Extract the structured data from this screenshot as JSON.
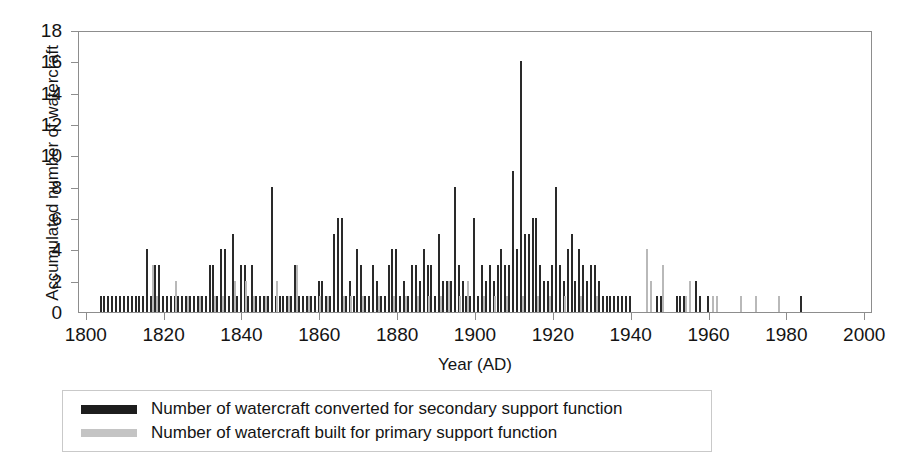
{
  "chart_data": {
    "type": "bar",
    "title": "",
    "xlabel": "Year (AD)",
    "ylabel": "Accumulated number of watercraft",
    "xlim": [
      1798,
      2002
    ],
    "ylim": [
      0,
      18
    ],
    "ytick_labels": [
      "18",
      "16",
      "14",
      "12",
      "10",
      "8",
      "6",
      "4",
      "2",
      "0"
    ],
    "ytick_values": [
      18,
      16,
      14,
      12,
      10,
      8,
      6,
      4,
      2,
      0
    ],
    "ytick_step": 2,
    "xtick_labels": [
      "1800",
      "1820",
      "1840",
      "1860",
      "1880",
      "1900",
      "1920",
      "1940",
      "1960",
      "1980",
      "2000"
    ],
    "xtick_values": [
      1800,
      1820,
      1840,
      1860,
      1880,
      1900,
      1920,
      1940,
      1960,
      1980,
      2000
    ],
    "xtick_step": 20,
    "grid": false,
    "legend_position": "below-plot",
    "colors": {
      "secondary": "#2a2a2a",
      "primary": "#b9b9b9",
      "frame": "#8d8d8d",
      "text": "#141414",
      "background": "#ffffff"
    },
    "series": [
      {
        "name": "Number of watercraft converted for secondary support function",
        "key": "secondary",
        "color": "#2a2a2a",
        "points": [
          [
            1803,
            1
          ],
          [
            1804,
            1
          ],
          [
            1805,
            1
          ],
          [
            1806,
            1
          ],
          [
            1807,
            1
          ],
          [
            1808,
            1
          ],
          [
            1809,
            1
          ],
          [
            1810,
            1
          ],
          [
            1811,
            1
          ],
          [
            1812,
            1
          ],
          [
            1813,
            1
          ],
          [
            1814,
            1
          ],
          [
            1815,
            4
          ],
          [
            1816,
            1
          ],
          [
            1817,
            3
          ],
          [
            1818,
            3
          ],
          [
            1819,
            1
          ],
          [
            1820,
            1
          ],
          [
            1821,
            1
          ],
          [
            1822,
            1
          ],
          [
            1823,
            1
          ],
          [
            1824,
            1
          ],
          [
            1825,
            1
          ],
          [
            1826,
            1
          ],
          [
            1827,
            1
          ],
          [
            1828,
            1
          ],
          [
            1829,
            1
          ],
          [
            1830,
            1
          ],
          [
            1831,
            3
          ],
          [
            1832,
            3
          ],
          [
            1833,
            1
          ],
          [
            1834,
            4
          ],
          [
            1835,
            4
          ],
          [
            1836,
            1
          ],
          [
            1837,
            5
          ],
          [
            1838,
            1
          ],
          [
            1839,
            3
          ],
          [
            1840,
            3
          ],
          [
            1841,
            1
          ],
          [
            1842,
            3
          ],
          [
            1843,
            1
          ],
          [
            1844,
            1
          ],
          [
            1845,
            1
          ],
          [
            1846,
            1
          ],
          [
            1847,
            8
          ],
          [
            1848,
            1
          ],
          [
            1849,
            1
          ],
          [
            1850,
            1
          ],
          [
            1851,
            1
          ],
          [
            1852,
            1
          ],
          [
            1853,
            3
          ],
          [
            1854,
            1
          ],
          [
            1855,
            1
          ],
          [
            1856,
            1
          ],
          [
            1857,
            1
          ],
          [
            1858,
            1
          ],
          [
            1859,
            2
          ],
          [
            1860,
            2
          ],
          [
            1861,
            1
          ],
          [
            1862,
            1
          ],
          [
            1863,
            5
          ],
          [
            1864,
            6
          ],
          [
            1865,
            6
          ],
          [
            1866,
            1
          ],
          [
            1867,
            2
          ],
          [
            1868,
            1
          ],
          [
            1869,
            4
          ],
          [
            1870,
            3
          ],
          [
            1871,
            1
          ],
          [
            1872,
            1
          ],
          [
            1873,
            3
          ],
          [
            1874,
            2
          ],
          [
            1875,
            1
          ],
          [
            1876,
            1
          ],
          [
            1877,
            3
          ],
          [
            1878,
            4
          ],
          [
            1879,
            4
          ],
          [
            1880,
            1
          ],
          [
            1881,
            2
          ],
          [
            1882,
            1
          ],
          [
            1883,
            3
          ],
          [
            1884,
            3
          ],
          [
            1885,
            2
          ],
          [
            1886,
            4
          ],
          [
            1887,
            3
          ],
          [
            1888,
            3
          ],
          [
            1889,
            1
          ],
          [
            1890,
            5
          ],
          [
            1891,
            2
          ],
          [
            1892,
            2
          ],
          [
            1893,
            2
          ],
          [
            1894,
            8
          ],
          [
            1895,
            3
          ],
          [
            1896,
            2
          ],
          [
            1897,
            1
          ],
          [
            1898,
            1
          ],
          [
            1899,
            6
          ],
          [
            1900,
            1
          ],
          [
            1901,
            3
          ],
          [
            1902,
            2
          ],
          [
            1903,
            3
          ],
          [
            1904,
            2
          ],
          [
            1905,
            3
          ],
          [
            1906,
            4
          ],
          [
            1907,
            3
          ],
          [
            1908,
            3
          ],
          [
            1909,
            9
          ],
          [
            1910,
            4
          ],
          [
            1911,
            16
          ],
          [
            1912,
            5
          ],
          [
            1913,
            5
          ],
          [
            1914,
            6
          ],
          [
            1915,
            6
          ],
          [
            1916,
            3
          ],
          [
            1917,
            2
          ],
          [
            1918,
            2
          ],
          [
            1919,
            3
          ],
          [
            1920,
            8
          ],
          [
            1921,
            3
          ],
          [
            1922,
            2
          ],
          [
            1923,
            4
          ],
          [
            1924,
            5
          ],
          [
            1925,
            2
          ],
          [
            1926,
            4
          ],
          [
            1927,
            3
          ],
          [
            1928,
            2
          ],
          [
            1929,
            3
          ],
          [
            1930,
            3
          ],
          [
            1931,
            2
          ],
          [
            1932,
            1
          ],
          [
            1933,
            1
          ],
          [
            1934,
            1
          ],
          [
            1935,
            1
          ],
          [
            1936,
            1
          ],
          [
            1937,
            1
          ],
          [
            1938,
            1
          ],
          [
            1939,
            1
          ],
          [
            1946,
            1
          ],
          [
            1947,
            1
          ],
          [
            1951,
            1
          ],
          [
            1952,
            1
          ],
          [
            1953,
            1
          ],
          [
            1956,
            2
          ],
          [
            1957,
            1
          ],
          [
            1959,
            1
          ],
          [
            1983,
            1
          ]
        ]
      },
      {
        "name": "Number of watercraft built for primary support function",
        "key": "primary",
        "color": "#b9b9b9",
        "points": [
          [
            1817,
            3
          ],
          [
            1818,
            1
          ],
          [
            1823,
            2
          ],
          [
            1826,
            1
          ],
          [
            1829,
            1
          ],
          [
            1833,
            1
          ],
          [
            1835,
            1
          ],
          [
            1838,
            2
          ],
          [
            1841,
            2
          ],
          [
            1843,
            1
          ],
          [
            1846,
            1
          ],
          [
            1849,
            2
          ],
          [
            1852,
            1
          ],
          [
            1854,
            3
          ],
          [
            1857,
            1
          ],
          [
            1860,
            1
          ],
          [
            1862,
            1
          ],
          [
            1866,
            1
          ],
          [
            1868,
            1
          ],
          [
            1871,
            1
          ],
          [
            1875,
            1
          ],
          [
            1879,
            1
          ],
          [
            1882,
            1
          ],
          [
            1885,
            1
          ],
          [
            1888,
            1
          ],
          [
            1891,
            1
          ],
          [
            1893,
            2
          ],
          [
            1896,
            1
          ],
          [
            1898,
            2
          ],
          [
            1902,
            1
          ],
          [
            1905,
            1
          ],
          [
            1908,
            1
          ],
          [
            1912,
            1
          ],
          [
            1916,
            1
          ],
          [
            1919,
            1
          ],
          [
            1923,
            1
          ],
          [
            1927,
            1
          ],
          [
            1931,
            1
          ],
          [
            1944,
            4
          ],
          [
            1945,
            2
          ],
          [
            1948,
            3
          ],
          [
            1954,
            1
          ],
          [
            1955,
            2
          ],
          [
            1961,
            1
          ],
          [
            1962,
            1
          ],
          [
            1968,
            1
          ],
          [
            1972,
            1
          ],
          [
            1978,
            1
          ]
        ]
      }
    ]
  },
  "legend": {
    "entries": [
      {
        "label": "Number of watercraft converted for secondary support function",
        "swatch": "secondary"
      },
      {
        "label": "Number of watercraft built for primary support function",
        "swatch": "primary"
      }
    ]
  }
}
